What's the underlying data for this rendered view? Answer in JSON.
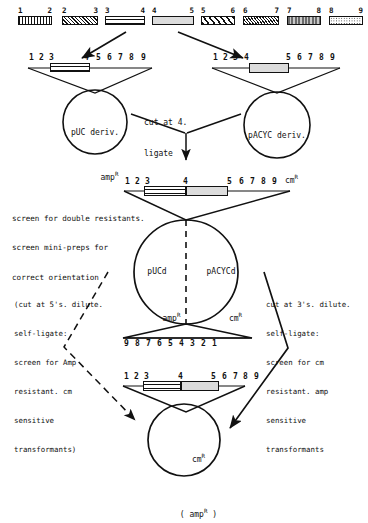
{
  "diagram": {
    "colors": {
      "ink": "#111111",
      "fill_light": "#f2f2f2",
      "fill_mid": "#d8d8d8",
      "fill_dark": "#9a9a9a"
    }
  },
  "top_row": {
    "fragments": [
      {
        "left_label": "1",
        "right_label": "2",
        "pattern": "vertical-stripes-dense",
        "x": 36,
        "width": 50
      },
      {
        "left_label": "2",
        "right_label": "3",
        "pattern": "crosshatch",
        "x": 98,
        "width": 52
      },
      {
        "left_label": "3",
        "right_label": "4",
        "pattern": "hollow-line",
        "x": 162,
        "width": 54
      },
      {
        "left_label": "4",
        "right_label": "5",
        "pattern": "solid-light",
        "x": 228,
        "width": 56
      },
      {
        "left_label": "5",
        "right_label": "6",
        "pattern": "diagonal-stripes",
        "x": 296,
        "width": 50
      },
      {
        "left_label": "6",
        "right_label": "7",
        "pattern": "fine-diagonal",
        "x": 358,
        "width": 52
      },
      {
        "left_label": "7",
        "right_label": "8",
        "pattern": "dark-vertical",
        "x": 420,
        "width": 50
      },
      {
        "left_label": "8",
        "right_label": "9",
        "pattern": "dotted-hollow",
        "x": 482,
        "width": 52
      }
    ]
  },
  "row2": {
    "left_construct": {
      "numbers": [
        "1",
        "2",
        "3",
        "4",
        "5",
        "6",
        "7",
        "8",
        "9"
      ],
      "inserted_fragment": "3-4"
    },
    "right_construct": {
      "numbers": [
        "1",
        "2",
        "3",
        "4",
        "5",
        "6",
        "7",
        "8",
        "9"
      ],
      "inserted_fragment": "4-5"
    }
  },
  "plasmids": {
    "left": {
      "name": "pUC deriv.",
      "marker": "amp",
      "marker_sup": "R"
    },
    "right": {
      "name": "pACYC deriv.",
      "marker": "cm",
      "marker_sup": "R"
    },
    "center_step": {
      "line1": "cut at 4.",
      "line2": "ligate"
    },
    "hybrid": {
      "left_name": "pUCd",
      "left_marker": "amp",
      "left_sup": "R",
      "right_name": "pACYCd",
      "right_marker": "cm",
      "right_sup": "R"
    },
    "final": {
      "marker": "cm",
      "marker_sup": "R",
      "secondary": "( amp",
      "secondary_sup": "R",
      "secondary_close": " )"
    }
  },
  "annotations": {
    "screen_block": [
      "screen for double resistants.",
      "screen mini-preps for",
      "correct orientation"
    ],
    "left_block": [
      "(cut at 5's. dilute.",
      "self-ligate:",
      "screen for Amp",
      "resistant. cm",
      "sensitive",
      "transformants)"
    ],
    "right_block": [
      "cut at 3's. dilute.",
      "self-ligate:",
      "screen for cm",
      "resistant. amp",
      "sensitive",
      "transformants"
    ]
  },
  "middle_construct": {
    "top_numbers": [
      "1",
      "2",
      "3",
      "4",
      "5",
      "6",
      "7",
      "8",
      "9"
    ],
    "bottom_numbers": [
      "9",
      "8",
      "7",
      "6",
      "5",
      "4",
      "3",
      "2",
      "1"
    ]
  },
  "bottom_construct": {
    "numbers": [
      "1",
      "2",
      "3",
      "4",
      "5",
      "6",
      "7",
      "8",
      "9"
    ]
  }
}
